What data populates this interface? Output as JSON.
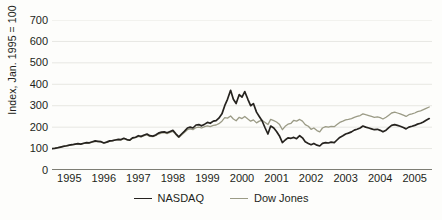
{
  "chart_data": {
    "type": "line",
    "title": "",
    "subtitle": "",
    "xlabel": "",
    "ylabel": "Index, Jan. 1995 = 100",
    "xlim": [
      1995.0,
      2006.0
    ],
    "ylim": [
      0,
      700
    ],
    "grid": true,
    "grid_axis": "y",
    "legend_position": "bottom-center",
    "y_ticks": [
      0,
      100,
      200,
      300,
      400,
      500,
      600,
      700
    ],
    "y_tick_labels": [
      "0",
      "100",
      "200",
      "300",
      "400",
      "500",
      "600",
      "700"
    ],
    "x_ticks": [
      1995,
      1996,
      1997,
      1998,
      1999,
      2000,
      2001,
      2002,
      2003,
      2004,
      2005
    ],
    "x_tick_labels": [
      "1995",
      "1996",
      "1997",
      "1998",
      "1999",
      "2000",
      "2001",
      "2002",
      "2003",
      "2004",
      "2005"
    ],
    "series": [
      {
        "name": "NASDAQ",
        "color": "#26231f",
        "x": [
          1995.0,
          1995.08,
          1995.17,
          1995.25,
          1995.33,
          1995.42,
          1995.5,
          1995.58,
          1995.67,
          1995.75,
          1995.83,
          1995.92,
          1996.0,
          1996.08,
          1996.17,
          1996.25,
          1996.33,
          1996.42,
          1996.5,
          1996.58,
          1996.67,
          1996.75,
          1996.83,
          1996.92,
          1997.0,
          1997.08,
          1997.17,
          1997.25,
          1997.33,
          1997.42,
          1997.5,
          1997.58,
          1997.67,
          1997.75,
          1997.83,
          1997.92,
          1998.0,
          1998.08,
          1998.17,
          1998.25,
          1998.33,
          1998.42,
          1998.5,
          1998.58,
          1998.67,
          1998.75,
          1998.83,
          1998.92,
          1999.0,
          1999.08,
          1999.17,
          1999.25,
          1999.33,
          1999.42,
          1999.5,
          1999.58,
          1999.67,
          1999.75,
          1999.83,
          1999.92,
          2000.0,
          2000.08,
          2000.17,
          2000.25,
          2000.33,
          2000.42,
          2000.5,
          2000.58,
          2000.67,
          2000.75,
          2000.83,
          2000.92,
          2001.0,
          2001.08,
          2001.17,
          2001.25,
          2001.33,
          2001.42,
          2001.5,
          2001.58,
          2001.67,
          2001.75,
          2001.83,
          2001.92,
          2002.0,
          2002.08,
          2002.17,
          2002.25,
          2002.33,
          2002.42,
          2002.5,
          2002.58,
          2002.67,
          2002.75,
          2002.83,
          2002.92,
          2003.0,
          2003.08,
          2003.17,
          2003.25,
          2003.33,
          2003.42,
          2003.5,
          2003.58,
          2003.67,
          2003.75,
          2003.83,
          2003.92,
          2004.0,
          2004.08,
          2004.17,
          2004.25,
          2004.33,
          2004.42,
          2004.5,
          2004.58,
          2004.67,
          2004.75,
          2004.83,
          2004.92,
          2005.0,
          2005.08,
          2005.17,
          2005.25,
          2005.33,
          2005.42,
          2005.5,
          2005.58,
          2005.67,
          2005.75,
          2005.83,
          2005.92
        ],
        "values": [
          100,
          101,
          104,
          107,
          110,
          113,
          116,
          118,
          121,
          123,
          121,
          125,
          128,
          127,
          132,
          136,
          134,
          132,
          126,
          130,
          136,
          137,
          140,
          143,
          142,
          148,
          142,
          139,
          150,
          153,
          160,
          157,
          163,
          168,
          160,
          158,
          163,
          172,
          177,
          178,
          174,
          180,
          185,
          170,
          155,
          168,
          180,
          196,
          200,
          196,
          210,
          212,
          206,
          214,
          222,
          218,
          228,
          230,
          242,
          262,
          300,
          330,
          372,
          330,
          310,
          352,
          340,
          366,
          330,
          300,
          310,
          270,
          250,
          230,
          196,
          168,
          205,
          196,
          180,
          160,
          128,
          140,
          150,
          148,
          152,
          146,
          160,
          150,
          132,
          124,
          118,
          124,
          116,
          112,
          124,
          128,
          126,
          130,
          128,
          140,
          152,
          160,
          168,
          172,
          178,
          186,
          190,
          196,
          205,
          200,
          196,
          192,
          188,
          190,
          185,
          178,
          186,
          198,
          208,
          212,
          208,
          204,
          198,
          192,
          200,
          204,
          208,
          214,
          218,
          224,
          232,
          240
        ]
      },
      {
        "name": "Dow Jones",
        "color": "#9b9b86",
        "x": [
          1995.0,
          1995.08,
          1995.17,
          1995.25,
          1995.33,
          1995.42,
          1995.5,
          1995.58,
          1995.67,
          1995.75,
          1995.83,
          1995.92,
          1996.0,
          1996.08,
          1996.17,
          1996.25,
          1996.33,
          1996.42,
          1996.5,
          1996.58,
          1996.67,
          1996.75,
          1996.83,
          1996.92,
          1997.0,
          1997.08,
          1997.17,
          1997.25,
          1997.33,
          1997.42,
          1997.5,
          1997.58,
          1997.67,
          1997.75,
          1997.83,
          1997.92,
          1998.0,
          1998.08,
          1998.17,
          1998.25,
          1998.33,
          1998.42,
          1998.5,
          1998.58,
          1998.67,
          1998.75,
          1998.83,
          1998.92,
          1999.0,
          1999.08,
          1999.17,
          1999.25,
          1999.33,
          1999.42,
          1999.5,
          1999.58,
          1999.67,
          1999.75,
          1999.83,
          1999.92,
          2000.0,
          2000.08,
          2000.17,
          2000.25,
          2000.33,
          2000.42,
          2000.5,
          2000.58,
          2000.67,
          2000.75,
          2000.83,
          2000.92,
          2001.0,
          2001.08,
          2001.17,
          2001.25,
          2001.33,
          2001.42,
          2001.5,
          2001.58,
          2001.67,
          2001.75,
          2001.83,
          2001.92,
          2002.0,
          2002.08,
          2002.17,
          2002.25,
          2002.33,
          2002.42,
          2002.5,
          2002.58,
          2002.67,
          2002.75,
          2002.83,
          2002.92,
          2003.0,
          2003.08,
          2003.17,
          2003.25,
          2003.33,
          2003.42,
          2003.5,
          2003.58,
          2003.67,
          2003.75,
          2003.83,
          2003.92,
          2004.0,
          2004.08,
          2004.17,
          2004.25,
          2004.33,
          2004.42,
          2004.5,
          2004.58,
          2004.67,
          2004.75,
          2004.83,
          2004.92,
          2005.0,
          2005.08,
          2005.17,
          2005.25,
          2005.33,
          2005.42,
          2005.5,
          2005.58,
          2005.67,
          2005.75,
          2005.83,
          2005.92
        ],
        "values": [
          100,
          102,
          105,
          108,
          110,
          112,
          115,
          117,
          120,
          122,
          120,
          124,
          126,
          126,
          130,
          133,
          132,
          131,
          126,
          129,
          134,
          136,
          139,
          142,
          140,
          146,
          141,
          138,
          148,
          151,
          157,
          154,
          160,
          164,
          157,
          156,
          160,
          168,
          172,
          174,
          170,
          176,
          180,
          166,
          152,
          163,
          175,
          188,
          192,
          188,
          198,
          200,
          196,
          202,
          206,
          202,
          208,
          210,
          216,
          228,
          244,
          242,
          252,
          238,
          230,
          246,
          240,
          250,
          238,
          228,
          234,
          220,
          228,
          232,
          222,
          212,
          236,
          230,
          224,
          214,
          188,
          204,
          214,
          218,
          232,
          228,
          236,
          228,
          212,
          204,
          190,
          196,
          184,
          178,
          196,
          202,
          200,
          204,
          202,
          212,
          222,
          228,
          234,
          236,
          240,
          246,
          250,
          254,
          262,
          258,
          254,
          250,
          246,
          248,
          244,
          238,
          246,
          256,
          266,
          270,
          266,
          262,
          256,
          250,
          258,
          262,
          266,
          272,
          276,
          282,
          288,
          294
        ]
      }
    ]
  },
  "legend": {
    "items": [
      {
        "label": "NASDAQ",
        "color": "#26231f",
        "width": 1.8
      },
      {
        "label": "Dow Jones",
        "color": "#9b9b86",
        "width": 1.4
      }
    ]
  },
  "axes": {
    "y_axis_title": "Index, Jan. 1995 = 100"
  },
  "colors": {
    "background": "#fdfdfb",
    "grid": "#e7e7e2",
    "axis": "#7d7d74",
    "text": "#231f20",
    "nasdaq": "#26231f",
    "dow_jones": "#9b9b86"
  }
}
